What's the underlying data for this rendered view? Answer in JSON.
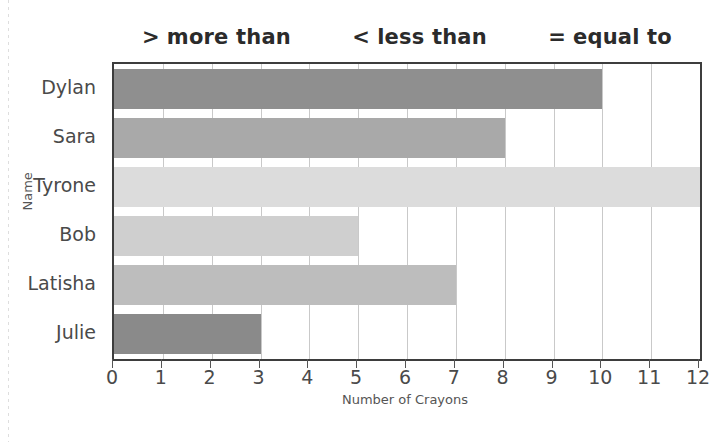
{
  "legend": {
    "items": [
      {
        "symbol": ">",
        "text": "more than"
      },
      {
        "symbol": "<",
        "text": "less than"
      },
      {
        "symbol": "=",
        "text": "equal to"
      }
    ]
  },
  "chart_data": {
    "type": "bar",
    "orientation": "horizontal",
    "title": "",
    "xlabel": "Number of Crayons",
    "ylabel": "Name",
    "categories": [
      "Dylan",
      "Sara",
      "Tyrone",
      "Bob",
      "Latisha",
      "Julie"
    ],
    "values": [
      10,
      8,
      12,
      5,
      7,
      3
    ],
    "bar_colors": [
      "#8f8f8f",
      "#a9a9a9",
      "#dcdcdc",
      "#cfcfcf",
      "#bdbdbd",
      "#8a8a8a"
    ],
    "xlim": [
      0,
      12
    ],
    "xticks": [
      0,
      1,
      2,
      3,
      4,
      5,
      6,
      7,
      8,
      9,
      10,
      11,
      12
    ],
    "xtick_labels": [
      "0",
      "1",
      "2",
      "3",
      "4",
      "5",
      "6",
      "7",
      "8",
      "9",
      "10",
      "11",
      "12"
    ],
    "grid": true,
    "grid_axis": "x",
    "legend_position": "top",
    "frame_color": "#3d3d3d",
    "gridline_color": "#c9c9c9"
  }
}
